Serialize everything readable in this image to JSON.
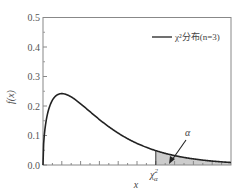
{
  "chart_data": {
    "type": "area",
    "title": "",
    "xlabel": "x",
    "ylabel": "f(x)",
    "ylim": [
      0.0,
      0.5
    ],
    "xlim": [
      0,
      10
    ],
    "yticks": [
      "0.0",
      "0.1",
      "0.2",
      "0.3",
      "0.4",
      "0.5"
    ],
    "grid": false,
    "legend": {
      "position": "upper right",
      "entries": [
        "χ²分布(n=3)"
      ]
    },
    "series": [
      {
        "name": "χ²分布(n=3)",
        "function": "chi2_pdf",
        "df": 3,
        "x": [
          0,
          0.25,
          0.5,
          1,
          1.5,
          2,
          3,
          4,
          5,
          6,
          7,
          8,
          9,
          10
        ],
        "values": [
          0,
          0.176,
          0.22,
          0.242,
          0.231,
          0.208,
          0.154,
          0.108,
          0.073,
          0.048,
          0.032,
          0.02,
          0.013,
          0.008
        ]
      }
    ],
    "annotations": [
      {
        "text": "α",
        "type": "arrow",
        "target": "shaded upper-tail area"
      },
      {
        "text": "χ²α",
        "type": "x-marker",
        "x": 6.0,
        "description": "critical value; area to the right shaded"
      }
    ]
  },
  "labels": {
    "ylabel": "f(x)",
    "xlabel": "x",
    "legend": "χ²分布(n=3)",
    "alpha": "α",
    "critical_main": "χ",
    "critical_sup": "2",
    "critical_sub": "α"
  },
  "colors": {
    "curve": "#222222",
    "shade": "#cccccc",
    "axis": "#777777"
  }
}
